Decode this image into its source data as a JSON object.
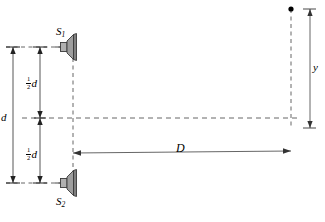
{
  "figure": {
    "type": "physics-diagram",
    "background_color": "#ffffff",
    "line_color": "#000000",
    "dash_color": "#555555",
    "speaker_fill": "#a8a8a8",
    "speaker_fill_dark": "#8a8a8a",
    "speaker_edge": "#3a3a3a"
  },
  "labels": {
    "source_top": "S",
    "source_top_sub": "1",
    "source_bottom": "S",
    "source_bottom_sub": "2",
    "separation": "d",
    "half_separation_num": "1",
    "half_separation_den": "2",
    "half_separation_var": "d",
    "distance": "D",
    "offset": "y"
  },
  "elements": {
    "speaker_top_name": "speaker-S1",
    "speaker_bottom_name": "speaker-S2",
    "screen_line_name": "screen-dashed-line",
    "axis_line_name": "central-axis-dashed-line",
    "point_name": "observation-point"
  },
  "geometry": {
    "speaker_top_y": 47,
    "speaker_bottom_y": 183,
    "axis_y": 118,
    "speaker_front_x": 73,
    "screen_x": 291,
    "point_y": 9,
    "d_arrow_x": 13,
    "half_d_arrow_x": 40,
    "D_arrow_y": 152,
    "y_arrow_x": 310
  }
}
